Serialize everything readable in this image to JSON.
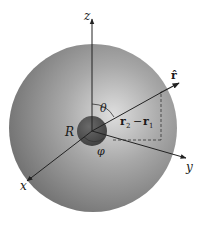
{
  "figure": {
    "labels": {
      "z_axis": "z",
      "y_axis": "y",
      "x_axis": "x",
      "r_hat": "r̂",
      "theta": "θ",
      "phi": "φ",
      "radius": "R",
      "separation_main": "r",
      "separation_sub2": "2",
      "separation_minus": "−",
      "separation_main2": "r",
      "separation_sub1": "1"
    },
    "colors": {
      "outer_sphere_light": "#d8d8d8",
      "outer_sphere_dark": "#7a7a7a",
      "inner_sphere": "#555555",
      "axis_line": "#222222"
    }
  }
}
